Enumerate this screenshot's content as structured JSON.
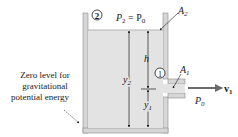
{
  "diagram": {
    "type": "fluid-tank-torricelli",
    "colors": {
      "water": "#e3e3e3",
      "wall": "#d6d6d6",
      "wall_stroke": "#8a8a8a",
      "arrow": "#1a1a1a",
      "flow_arrow": "#6a6a6a"
    },
    "labels": {
      "point2": "2",
      "point1": "1",
      "pressure_top": "P",
      "pressure_top_sub": "2",
      "pressure_top_eq": " = P",
      "pressure_top_eq_sub": "0",
      "area_top": "A",
      "area_top_sub": "2",
      "area_outlet": "A",
      "area_outlet_sub": "1",
      "height_h": "h",
      "height_y2": "y",
      "height_y2_sub": "2",
      "height_y1": "y",
      "height_y1_sub": "1",
      "outlet_pressure": "P",
      "outlet_pressure_sub": "0",
      "velocity": "v",
      "velocity_sub": "1",
      "zero_level_line1": "Zero level for",
      "zero_level_line2": "gravitational",
      "zero_level_line3": "potential energy"
    }
  }
}
